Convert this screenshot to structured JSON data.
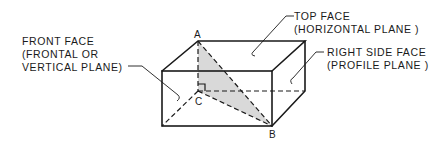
{
  "diagram": {
    "type": "isometric rectangular prism with internal triangle",
    "labels": {
      "front_face": {
        "line1": "FRONT FACE",
        "line2": "(FRONTAL OR",
        "line3": "VERTICAL PLANE)"
      },
      "top_face": {
        "line1": "TOP FACE",
        "line2": "(HORIZONTAL PLANE )"
      },
      "right_side_face": {
        "line1": "RIGHT SIDE FACE",
        "line2": "(PROFILE PLANE )"
      }
    },
    "points": {
      "a": "A",
      "b": "B",
      "c": "C"
    },
    "colors": {
      "line": "#1a1a1a",
      "shaded_triangle": "#d9d9d9",
      "background": "#ffffff"
    }
  }
}
